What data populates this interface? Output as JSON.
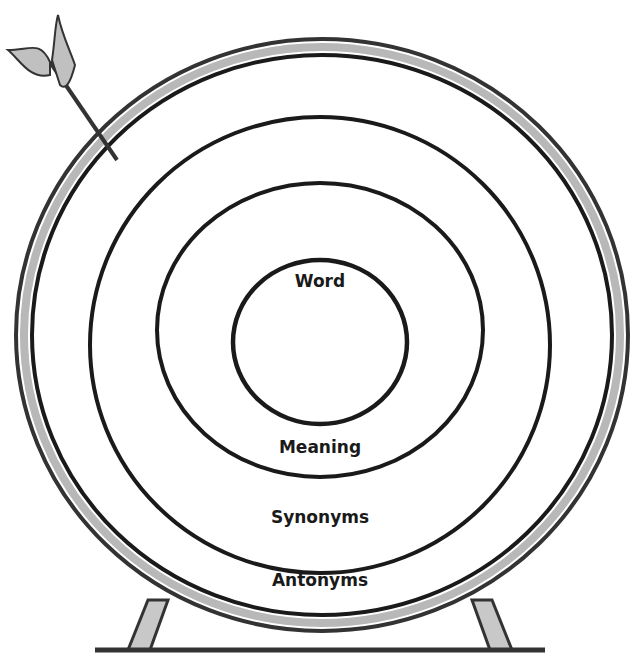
{
  "diagram": {
    "type": "target-rings",
    "rings": [
      {
        "label": "Word",
        "level": 1
      },
      {
        "label": "Meaning",
        "level": 2
      },
      {
        "label": "Synonyms",
        "level": 3
      },
      {
        "label": "Antonyms",
        "level": 4
      }
    ],
    "decorations": [
      "arrow-with-feather",
      "target-stand"
    ]
  },
  "colors": {
    "ink": "#1a1a1a",
    "shade": "#b8b8b8",
    "background": "#ffffff"
  }
}
